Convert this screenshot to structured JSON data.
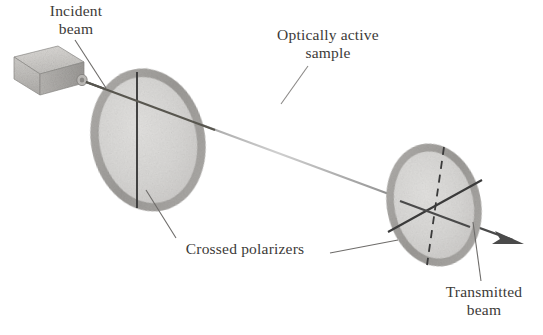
{
  "figure": {
    "background_color": "#ffffff",
    "labels": {
      "incident_beam": {
        "line1": "Incident",
        "line2": "beam"
      },
      "optically_active_sample": {
        "line1": "Optically active",
        "line2": "sample"
      },
      "crossed_polarizers": {
        "line1": "Crossed polarizers"
      },
      "transmitted_beam": {
        "line1": "Transmitted",
        "line2": "beam"
      }
    },
    "colors": {
      "text": "#3c3a38",
      "beam": "#4a4a4a",
      "beam_faded": "#c9c9c9",
      "leader_line": "#6e6c6a",
      "disk_rim": "#a9a7a5",
      "disk_face": "#d9d8d6",
      "source_body": "#c8c6c3",
      "source_shade": "#a5a3a0",
      "axis_line": "#3a3a3a"
    },
    "elements": {
      "light_source": {
        "name": "light-source-box"
      },
      "polarizer_first": {
        "name": "first-polarizer",
        "axis": "vertical-solid"
      },
      "polarizer_second": {
        "name": "second-polarizer",
        "axis": "rotated-solid",
        "reference_axis": "vertical-dashed"
      },
      "beam": {
        "name": "light-beam",
        "direction": "left-to-right-descending",
        "arrowhead": "right"
      }
    }
  }
}
